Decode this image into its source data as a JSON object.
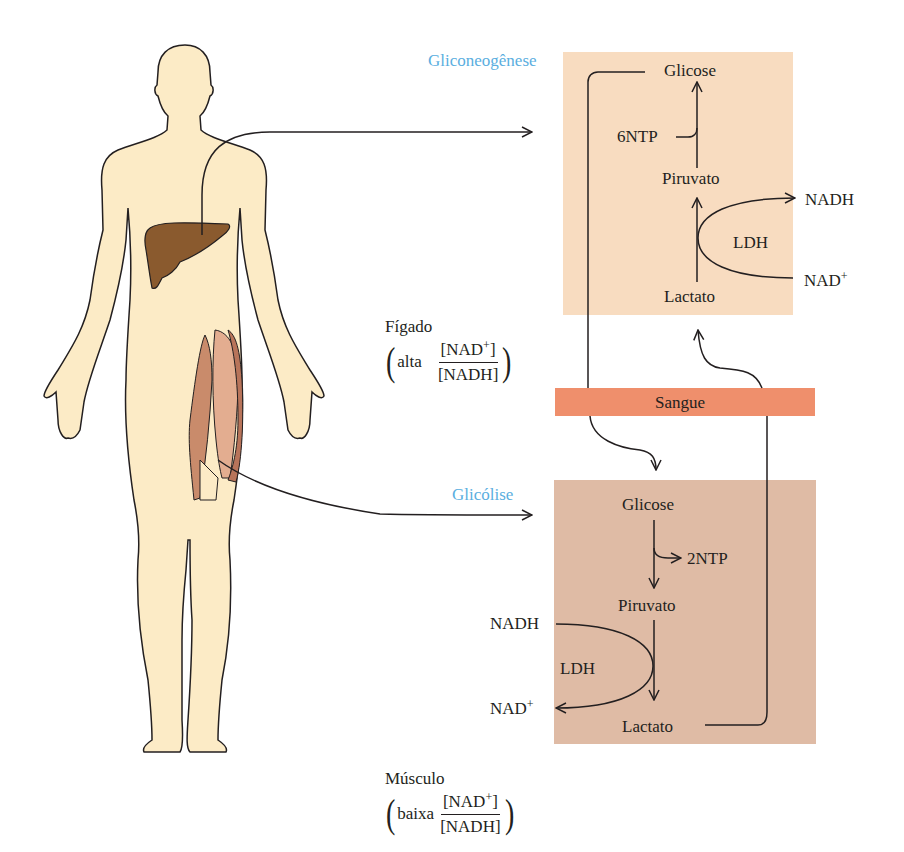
{
  "colors": {
    "skin": "#fcebc6",
    "liver": "#8a5a2e",
    "muscle": "#c98b6b",
    "liver_box": "#f8dcc0",
    "muscle_box": "#dfbba5",
    "blood": "#ef8f6c",
    "title": "#5aaee0",
    "line": "#231f20"
  },
  "liver_panel": {
    "title": "Gliconeogênese",
    "glucose": "Glicose",
    "ntp": "6NTP",
    "pyruvate": "Piruvato",
    "nadh": "NADH",
    "ldh": "LDH",
    "nad": "NAD",
    "nad_charge": "+",
    "lactate": "Lactato"
  },
  "liver_label": {
    "organ": "Fígado",
    "qualifier": "alta",
    "numerator": "[NAD",
    "numerator_charge": "+",
    "numerator_close": "]",
    "denominator": "[NADH]"
  },
  "blood": {
    "label": "Sangue"
  },
  "muscle_panel": {
    "title": "Glicólise",
    "glucose": "Glicose",
    "ntp": "2NTP",
    "pyruvate": "Piruvato",
    "nadh": "NADH",
    "ldh": "LDH",
    "nad": "NAD",
    "nad_charge": "+",
    "lactate": "Lactato"
  },
  "muscle_label": {
    "organ": "Músculo",
    "qualifier": "baixa",
    "numerator": "[NAD",
    "numerator_charge": "+",
    "numerator_close": "]",
    "denominator": "[NADH]"
  }
}
